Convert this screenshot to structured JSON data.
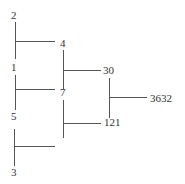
{
  "diagram": {
    "type": "summation-tree",
    "line_color": "#555555",
    "text_color": "#333333",
    "leaves": [
      {
        "id": "leaf-2",
        "value": "2"
      },
      {
        "id": "leaf-1",
        "value": "1"
      },
      {
        "id": "leaf-5",
        "value": "5"
      },
      {
        "id": "leaf-3",
        "value": "3"
      }
    ],
    "level1": [
      {
        "id": "n-4",
        "value": "4"
      },
      {
        "id": "n-7",
        "value": "7"
      },
      {
        "id": "n-empty",
        "value": ""
      }
    ],
    "level2": [
      {
        "id": "n-30",
        "value": "30"
      },
      {
        "id": "n-121",
        "value": "121"
      }
    ],
    "root": {
      "id": "n-3632",
      "value": "3632"
    }
  }
}
